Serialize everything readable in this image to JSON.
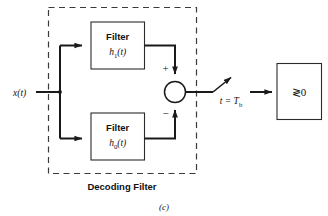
{
  "figure": {
    "caption": "(c)",
    "region_label": "Decoding Filter",
    "input_signal": "x(t)",
    "sampling_label_lhs": "t",
    "sampling_label_eq": "=",
    "sampling_label_rhs": "T",
    "sampling_label_rhs_sub": "b",
    "decision_label": "≷0",
    "sum_plus": "+",
    "sum_minus": "−",
    "colors": {
      "ink": "#1a1a1a",
      "box_stroke": "#2b2b2b",
      "dash_stroke": "#3a3a3a",
      "background": "#ffffff"
    }
  },
  "blocks": [
    {
      "id": "filter-upper",
      "title": "Filter",
      "impulse_response_base": "h",
      "impulse_response_sub": "1",
      "impulse_response_arg": "(t)"
    },
    {
      "id": "filter-lower",
      "title": "Filter",
      "impulse_response_base": "h",
      "impulse_response_sub": "0",
      "impulse_response_arg": "(t)"
    }
  ]
}
